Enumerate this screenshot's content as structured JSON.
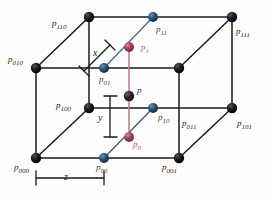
{
  "figure": {
    "width": 272,
    "height": 198,
    "colors": {
      "wire": "#1a1a1a",
      "corner_node": "#111111",
      "blue_node": "#2e5777",
      "blue_node_dark": "#24455f",
      "red_node": "#a8465c",
      "purple_node": "#3d2040",
      "interp_line_blue": "#4a6e8a",
      "interp_line_red": "#c07f8f",
      "background": "#fefefe"
    },
    "corner_labels": [
      {
        "name": "p110",
        "base": "p",
        "sub": "110",
        "x": 52,
        "y": 18,
        "color": "dark"
      },
      {
        "name": "p111",
        "base": "p",
        "sub": "111",
        "x": 236,
        "y": 26,
        "color": "dark"
      },
      {
        "name": "p010",
        "base": "p",
        "sub": "010",
        "x": 8,
        "y": 54,
        "color": "dark"
      },
      {
        "name": "p100",
        "base": "p",
        "sub": "100",
        "x": 56,
        "y": 105,
        "color": "dark"
      },
      {
        "name": "p011",
        "base": "p",
        "sub": "011",
        "x": 182,
        "y": 122,
        "color": "dark"
      },
      {
        "name": "p101",
        "base": "p",
        "sub": "101",
        "x": 237,
        "y": 122,
        "color": "dark"
      },
      {
        "name": "p000",
        "base": "p",
        "sub": "000",
        "x": 16,
        "y": 165,
        "color": "dark"
      },
      {
        "name": "p001",
        "base": "p",
        "sub": "001",
        "x": 162,
        "y": 165,
        "color": "dark"
      }
    ],
    "interp_labels": [
      {
        "name": "p11",
        "base": "p",
        "sub": "11",
        "x": 156,
        "y": 27,
        "color": "blue"
      },
      {
        "name": "p01",
        "base": "p",
        "sub": "01",
        "x": 99,
        "y": 79,
        "color": "blue"
      },
      {
        "name": "p1",
        "base": "p",
        "sub": "1",
        "x": 141,
        "y": 45,
        "color": "red"
      },
      {
        "name": "p",
        "base": "p",
        "sub": "",
        "x": 137,
        "y": 88,
        "color": "dark"
      },
      {
        "name": "p10",
        "base": "p",
        "sub": "10",
        "x": 158,
        "y": 116,
        "color": "blue"
      },
      {
        "name": "p0",
        "base": "p",
        "sub": "0",
        "x": 133,
        "y": 142,
        "color": "red"
      },
      {
        "name": "p00",
        "base": "p",
        "sub": "00",
        "x": 96,
        "y": 165,
        "color": "blue"
      }
    ],
    "dimension_labels": [
      {
        "name": "dim-x",
        "text": "x",
        "x": 93,
        "y": 50
      },
      {
        "name": "dim-y",
        "text": "y",
        "x": 98,
        "y": 120
      },
      {
        "name": "dim-z",
        "text": "z",
        "x": 64,
        "y": 176
      }
    ]
  }
}
